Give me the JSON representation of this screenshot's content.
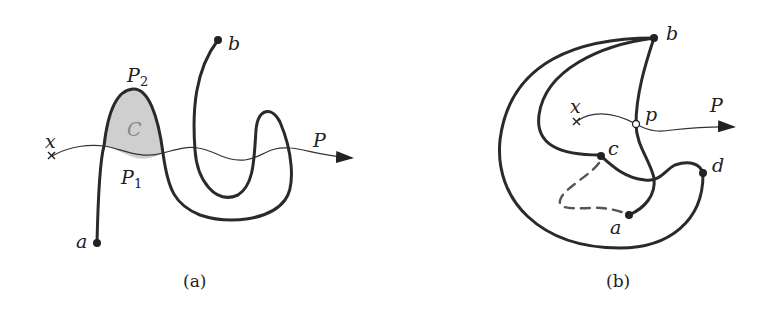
{
  "figure": {
    "panel_a": {
      "caption": "(a)",
      "labels": {
        "a": "a",
        "b": "b",
        "x": "x",
        "P": "P",
        "P1": "P",
        "P1_sub": "1",
        "P2": "P",
        "P2_sub": "2",
        "C": "C"
      },
      "colors": {
        "curve": "#2a2a2a",
        "region_fill": "#cfcfcf",
        "region_label": "#888888"
      }
    },
    "panel_b": {
      "caption": "(b)",
      "labels": {
        "a": "a",
        "b": "b",
        "c": "c",
        "d": "d",
        "p": "p",
        "x": "x",
        "P": "P"
      },
      "colors": {
        "curve": "#2a2a2a",
        "dashed": "#555555",
        "open_point": "#ffffff"
      }
    }
  }
}
